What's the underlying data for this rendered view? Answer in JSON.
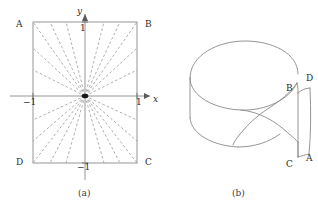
{
  "figure": {
    "background_color": "#ffffff",
    "stroke_color": "#8a8a8a",
    "dash_color": "#9a9a9a",
    "text_color": "#2b2b2b",
    "panels": [
      {
        "id": "a",
        "caption": "(a)",
        "type": "square-with-radial-dashed-lines",
        "corner_labels": [
          {
            "name": "A",
            "position": "top-left"
          },
          {
            "name": "B",
            "position": "top-right"
          },
          {
            "name": "C",
            "position": "bottom-right"
          },
          {
            "name": "D",
            "position": "bottom-left"
          }
        ],
        "axes": {
          "x_label": "x",
          "y_label": "y",
          "x_ticks": [
            {
              "label": "−1",
              "value": -1
            },
            {
              "label": "1",
              "value": 1
            }
          ],
          "y_ticks": [
            {
              "label": "1",
              "value": 1
            },
            {
              "label": "−1",
              "value": -1
            }
          ]
        },
        "radial_line_count": 16,
        "center_marker": "filled-dot"
      },
      {
        "id": "b",
        "caption": "(b)",
        "type": "moebius-band",
        "point_labels": [
          {
            "name": "B",
            "position": "upper-right-edge"
          },
          {
            "name": "D",
            "position": "upper-far-right"
          },
          {
            "name": "C",
            "position": "lower-right-edge"
          },
          {
            "name": "A",
            "position": "lower-far-right"
          }
        ]
      }
    ]
  }
}
